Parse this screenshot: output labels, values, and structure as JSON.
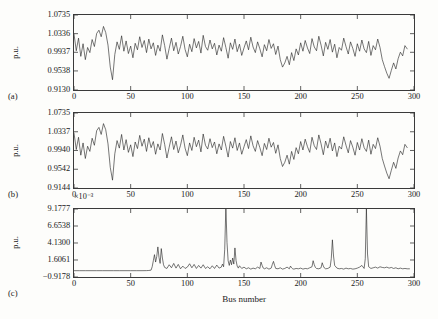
{
  "figure": {
    "background_color": "#fdfdfb",
    "trace_color": "#222222",
    "axis_color": "#3a3a3a",
    "xlabel": "Bus number",
    "ylabel": "p.u.",
    "panel_labels": [
      "(a)",
      "(b)",
      "(c)"
    ],
    "exponent_note": "×10⁻³"
  },
  "chart_data": [
    {
      "type": "line",
      "panel": "(a)",
      "title": "",
      "xlabel": "Bus number",
      "ylabel": "p.u.",
      "xlim": [
        0,
        300
      ],
      "ylim": [
        0.913,
        1.0735
      ],
      "xticks": [
        0,
        50,
        100,
        150,
        200,
        250,
        300
      ],
      "xticklabels": [
        "0",
        "50",
        "100",
        "150",
        "200",
        "250",
        "300"
      ],
      "yticks": [
        0.913,
        0.9538,
        0.9937,
        1.0336,
        1.0735
      ],
      "yticklabels": [
        "0.9130",
        "0.9538",
        "0.9937",
        "1.0336",
        "1.0735"
      ],
      "grid": false,
      "legend": "none",
      "series": [
        {
          "name": "voltage magnitude",
          "x": [
            0,
            2,
            4,
            6,
            8,
            10,
            12,
            14,
            16,
            18,
            20,
            22,
            24,
            26,
            28,
            30,
            32,
            34,
            36,
            38,
            40,
            42,
            44,
            46,
            48,
            50,
            52,
            54,
            56,
            58,
            60,
            62,
            64,
            66,
            68,
            70,
            72,
            74,
            76,
            78,
            80,
            82,
            84,
            86,
            88,
            90,
            92,
            94,
            96,
            98,
            100,
            102,
            104,
            106,
            108,
            110,
            112,
            114,
            116,
            118,
            120,
            122,
            124,
            126,
            128,
            130,
            132,
            134,
            136,
            138,
            140,
            142,
            144,
            146,
            148,
            150,
            152,
            154,
            156,
            158,
            160,
            162,
            164,
            166,
            168,
            170,
            172,
            174,
            176,
            178,
            180,
            182,
            184,
            186,
            188,
            190,
            192,
            194,
            196,
            198,
            200,
            202,
            204,
            206,
            208,
            210,
            212,
            214,
            216,
            218,
            220,
            222,
            224,
            226,
            228,
            230,
            232,
            234,
            236,
            238,
            240,
            242,
            244,
            246,
            248,
            250,
            252,
            254,
            256,
            258,
            260,
            262,
            264,
            266,
            268,
            270,
            272,
            274,
            276,
            278,
            280,
            282,
            284,
            286,
            288,
            290,
            292,
            294,
            296,
            298,
            300
          ],
          "values": [
            1.033,
            0.997,
            1.024,
            0.985,
            1.012,
            0.978,
            1.004,
            0.993,
            1.021,
            1.006,
            1.034,
            1.041,
            1.027,
            1.049,
            1.036,
            1.009,
            0.962,
            0.935,
            0.989,
            1.016,
            1.0,
            1.029,
            0.996,
            1.018,
            0.991,
            1.007,
            0.982,
            1.013,
            0.999,
            1.027,
            1.004,
            1.019,
            0.993,
            1.022,
            1.001,
            1.014,
            0.987,
            1.009,
            0.996,
            1.031,
            1.008,
            0.979,
            1.002,
            1.024,
            0.997,
            1.015,
            0.99,
            1.006,
            1.028,
            1.0,
            0.984,
            1.011,
            0.995,
            1.023,
            1.003,
            1.017,
            0.992,
            1.03,
            1.006,
            0.998,
            1.02,
            1.001,
            1.013,
            0.988,
            1.009,
            0.996,
            1.025,
            1.004,
            0.981,
            1.014,
            1.0,
            1.022,
            0.995,
            1.011,
            0.987,
            1.003,
            1.018,
            0.999,
            1.026,
            1.005,
            0.993,
            1.016,
            1.001,
            0.984,
            1.01,
            0.997,
            1.021,
            1.002,
            1.012,
            0.989,
            1.007,
            0.978,
            0.962,
            0.971,
            0.985,
            0.967,
            0.993,
            0.976,
            1.001,
            0.988,
            1.014,
            0.996,
            1.019,
            1.003,
            0.991,
            1.023,
            1.005,
            0.997,
            1.028,
            1.009,
            0.986,
            1.015,
            1.0,
            1.021,
            0.994,
            1.011,
            0.982,
            1.004,
            0.998,
            1.024,
            1.006,
            0.99,
            1.016,
            1.002,
            0.985,
            1.012,
            0.996,
            1.02,
            1.001,
            0.993,
            1.017,
            0.987,
            1.008,
            0.999,
            1.022,
            1.004,
            0.978,
            0.963,
            0.949,
            0.938,
            0.955,
            0.971,
            0.958,
            0.98,
            0.994,
            0.986,
            1.008,
            1.001
          ]
        }
      ]
    },
    {
      "type": "line",
      "panel": "(b)",
      "title": "",
      "xlabel": "Bus number",
      "ylabel": "p.u.",
      "xlim": [
        0,
        300
      ],
      "ylim": [
        0.9144,
        1.0735
      ],
      "xticks": [
        0,
        50,
        100,
        150,
        200,
        250,
        300
      ],
      "xticklabels": [
        "0",
        "50",
        "100",
        "150",
        "200",
        "250",
        "300"
      ],
      "yticks": [
        0.9144,
        0.9542,
        0.994,
        1.0337,
        1.0735
      ],
      "yticklabels": [
        "0.9144",
        "0.9542",
        "0.9940",
        "1.0337",
        "1.0735"
      ],
      "grid": false,
      "legend": "none",
      "series": [
        {
          "name": "voltage magnitude",
          "x": [
            0,
            2,
            4,
            6,
            8,
            10,
            12,
            14,
            16,
            18,
            20,
            22,
            24,
            26,
            28,
            30,
            32,
            34,
            36,
            38,
            40,
            42,
            44,
            46,
            48,
            50,
            52,
            54,
            56,
            58,
            60,
            62,
            64,
            66,
            68,
            70,
            72,
            74,
            76,
            78,
            80,
            82,
            84,
            86,
            88,
            90,
            92,
            94,
            96,
            98,
            100,
            102,
            104,
            106,
            108,
            110,
            112,
            114,
            116,
            118,
            120,
            122,
            124,
            126,
            128,
            130,
            132,
            134,
            136,
            138,
            140,
            142,
            144,
            146,
            148,
            150,
            152,
            154,
            156,
            158,
            160,
            162,
            164,
            166,
            168,
            170,
            172,
            174,
            176,
            178,
            180,
            182,
            184,
            186,
            188,
            190,
            192,
            194,
            196,
            198,
            200,
            202,
            204,
            206,
            208,
            210,
            212,
            214,
            216,
            218,
            220,
            222,
            224,
            226,
            228,
            230,
            232,
            234,
            236,
            238,
            240,
            242,
            244,
            246,
            248,
            250,
            252,
            254,
            256,
            258,
            260,
            262,
            264,
            266,
            268,
            270,
            272,
            274,
            276,
            278,
            280,
            282,
            284,
            286,
            288,
            290,
            292,
            294,
            296,
            298,
            300
          ],
          "values": [
            1.031,
            0.996,
            1.022,
            0.984,
            1.01,
            0.977,
            1.003,
            0.992,
            1.02,
            1.005,
            1.036,
            1.043,
            1.028,
            1.051,
            1.038,
            1.008,
            0.958,
            0.931,
            0.987,
            1.015,
            0.999,
            1.028,
            0.995,
            1.017,
            0.99,
            1.006,
            0.981,
            1.012,
            0.998,
            1.026,
            1.003,
            1.018,
            0.992,
            1.021,
            1.0,
            1.013,
            0.986,
            1.008,
            0.995,
            1.03,
            1.007,
            0.978,
            1.001,
            1.023,
            0.996,
            1.014,
            0.989,
            1.005,
            1.027,
            0.999,
            0.983,
            1.01,
            0.994,
            1.022,
            1.002,
            1.016,
            0.991,
            1.029,
            1.005,
            0.997,
            1.019,
            1.0,
            1.012,
            0.987,
            1.008,
            0.995,
            1.024,
            1.003,
            0.98,
            1.013,
            0.999,
            1.021,
            0.994,
            1.01,
            0.986,
            1.002,
            1.017,
            0.998,
            1.025,
            1.004,
            0.992,
            1.015,
            1.0,
            0.983,
            1.009,
            0.996,
            1.02,
            1.001,
            1.011,
            0.988,
            1.006,
            0.977,
            0.96,
            0.969,
            0.984,
            0.965,
            0.992,
            0.975,
            1.0,
            0.987,
            1.013,
            0.995,
            1.018,
            1.002,
            0.99,
            1.022,
            1.004,
            0.996,
            1.027,
            1.008,
            0.985,
            1.014,
            0.999,
            1.02,
            0.993,
            1.01,
            0.981,
            1.003,
            0.997,
            1.023,
            1.005,
            0.989,
            1.015,
            1.001,
            0.984,
            1.011,
            0.995,
            1.019,
            1.0,
            0.992,
            1.016,
            0.986,
            1.007,
            0.998,
            1.021,
            1.003,
            0.977,
            0.961,
            0.946,
            0.934,
            0.952,
            0.969,
            0.956,
            0.978,
            0.993,
            0.985,
            1.007,
            1.0
          ]
        }
      ]
    },
    {
      "type": "line",
      "panel": "(c)",
      "title": "",
      "xlabel": "Bus number",
      "ylabel": "p.u.",
      "y_scale_note": "×10⁻³",
      "xlim": [
        0,
        300
      ],
      "ylim": [
        -0.9178,
        9.1777
      ],
      "xticks": [
        0,
        50,
        100,
        150,
        200,
        250,
        300
      ],
      "xticklabels": [
        "0",
        "50",
        "100",
        "150",
        "200",
        "250",
        "300"
      ],
      "yticks": [
        -0.9178,
        1.6061,
        4.13,
        6.6538,
        9.1777
      ],
      "yticklabels": [
        "−0.9178",
        "1.6061",
        "4.1300",
        "6.6538",
        "9.1777"
      ],
      "grid": false,
      "legend": "none",
      "series": [
        {
          "name": "voltage error",
          "x": [
            0,
            5,
            10,
            15,
            20,
            25,
            30,
            35,
            40,
            45,
            50,
            55,
            60,
            64,
            66,
            68,
            69,
            70,
            71,
            72,
            73,
            74,
            75,
            76,
            77,
            78,
            79,
            80,
            82,
            84,
            86,
            88,
            90,
            92,
            94,
            96,
            98,
            100,
            102,
            104,
            106,
            108,
            110,
            112,
            114,
            116,
            118,
            120,
            122,
            124,
            126,
            128,
            130,
            131,
            132,
            133,
            134,
            135,
            136,
            137,
            138,
            139,
            140,
            141,
            142,
            143,
            144,
            145,
            146,
            148,
            150,
            152,
            154,
            156,
            158,
            160,
            162,
            164,
            165,
            166,
            167,
            168,
            170,
            172,
            174,
            175,
            176,
            177,
            178,
            180,
            182,
            184,
            186,
            188,
            190,
            191,
            192,
            193,
            194,
            196,
            198,
            200,
            202,
            204,
            206,
            208,
            210,
            211,
            212,
            213,
            214,
            216,
            218,
            219,
            220,
            221,
            222,
            224,
            226,
            227,
            228,
            229,
            230,
            232,
            234,
            236,
            238,
            240,
            242,
            244,
            246,
            248,
            250,
            252,
            254,
            256,
            257,
            258,
            259,
            260,
            262,
            264,
            266,
            268,
            270,
            272,
            274,
            276,
            278,
            280,
            282,
            284,
            286,
            288,
            290,
            292,
            294,
            296,
            298,
            300
          ],
          "values": [
            0.02,
            0.02,
            0.02,
            0.02,
            0.02,
            0.02,
            0.02,
            0.02,
            0.02,
            0.02,
            0.02,
            0.02,
            0.02,
            0.03,
            0.05,
            0.1,
            0.6,
            1.5,
            2.4,
            1.3,
            2.1,
            3.55,
            2.0,
            1.1,
            3.3,
            1.9,
            0.9,
            0.5,
            0.35,
            0.9,
            0.45,
            1.1,
            0.4,
            0.95,
            0.3,
            0.7,
            0.35,
            0.55,
            1.05,
            0.45,
            0.95,
            0.35,
            0.8,
            0.4,
            0.9,
            0.35,
            0.6,
            0.3,
            0.75,
            0.35,
            0.85,
            0.4,
            0.55,
            1.0,
            0.6,
            3.2,
            9.6,
            4.2,
            1.5,
            0.8,
            1.6,
            0.9,
            1.9,
            1.0,
            3.4,
            1.5,
            0.7,
            0.4,
            0.75,
            0.35,
            0.55,
            0.3,
            0.45,
            0.25,
            0.4,
            0.3,
            0.55,
            0.35,
            1.3,
            0.8,
            0.4,
            0.3,
            0.45,
            0.25,
            0.4,
            0.95,
            1.4,
            0.8,
            0.35,
            0.3,
            0.45,
            0.25,
            0.35,
            0.55,
            0.3,
            0.7,
            0.45,
            0.3,
            0.25,
            0.35,
            0.3,
            0.4,
            0.25,
            0.35,
            0.3,
            0.45,
            0.6,
            1.5,
            0.9,
            0.5,
            0.35,
            0.3,
            0.45,
            1.2,
            0.7,
            0.4,
            0.3,
            0.35,
            0.55,
            1.8,
            4.6,
            2.2,
            0.8,
            0.4,
            0.3,
            0.35,
            0.25,
            0.4,
            0.3,
            0.35,
            0.25,
            0.3,
            0.4,
            0.55,
            0.8,
            0.35,
            1.8,
            9.3,
            2.5,
            0.6,
            0.35,
            0.45,
            0.55,
            0.4,
            0.6,
            0.5,
            0.45,
            0.55,
            0.4,
            0.5,
            0.35,
            0.45,
            0.3,
            0.4,
            0.3,
            0.35,
            0.3,
            0.3
          ]
        }
      ]
    }
  ]
}
